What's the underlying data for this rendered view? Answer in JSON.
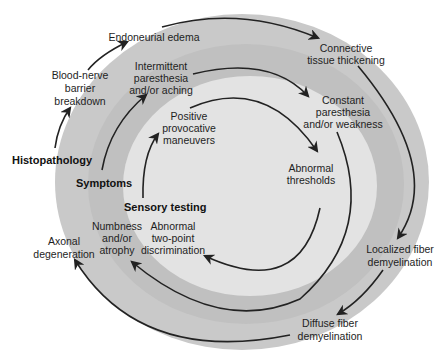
{
  "colors": {
    "background": "#ffffff",
    "outer_band": "#c9c9c9",
    "middle_band": "#c0c0c0",
    "inner_disc": "#e3e3e3",
    "arrow": "#222222",
    "text": "#1e1e1e"
  },
  "rings": [
    {
      "name": "Histopathology",
      "label": "Histopathology",
      "stages": [
        {
          "lines": [
            "Blood-nerve",
            "barrier",
            "breakdown"
          ]
        },
        {
          "lines": [
            "Endoneurial edema"
          ]
        },
        {
          "lines": [
            "Connective",
            "tissue thickening"
          ]
        },
        {
          "lines": [
            "Localized fiber",
            "demyelination"
          ]
        },
        {
          "lines": [
            "Diffuse fiber",
            "demyelination"
          ]
        },
        {
          "lines": [
            "Axonal",
            "degeneration"
          ]
        }
      ]
    },
    {
      "name": "Symptoms",
      "label": "Symptoms",
      "stages": [
        {
          "lines": [
            "Intermittent",
            "paresthesia",
            "and/or aching"
          ]
        },
        {
          "lines": [
            "Constant",
            "paresthesia",
            "and/or weakness"
          ]
        },
        {
          "lines": [
            "Numbness",
            "and/or",
            "atrophy"
          ]
        }
      ]
    },
    {
      "name": "Sensory testing",
      "label": "Sensory testing",
      "stages": [
        {
          "lines": [
            "Positive",
            "provocative",
            "maneuvers"
          ]
        },
        {
          "lines": [
            "Abnormal",
            "thresholds"
          ]
        },
        {
          "lines": [
            "Abnormal",
            "two-point",
            "discrimination"
          ]
        }
      ]
    }
  ]
}
